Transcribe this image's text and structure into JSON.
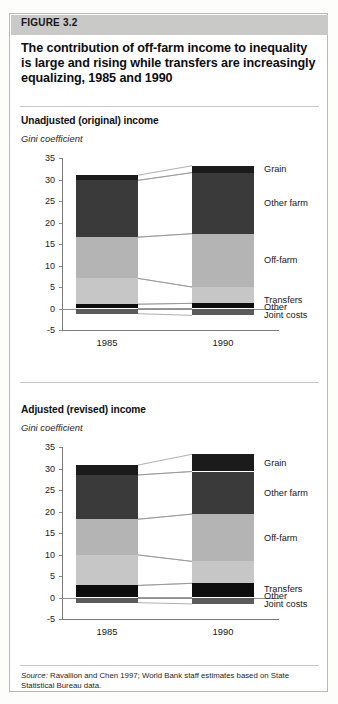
{
  "figure": {
    "band_label": "FIGURE 3.2",
    "title": "The contribution of off-farm income to inequality is large and rising while transfers are increasingly equalizing, 1985 and 1990",
    "source_prefix": "Source:",
    "source_text": " Ravallion and Chen 1997; World Bank staff estimates based on State Statistical Bureau data."
  },
  "panels": [
    {
      "title": "Unadjusted (original) income",
      "subtitle": "Gini coefficient"
    },
    {
      "title": "Adjusted (revised) income",
      "subtitle": "Gini coefficient"
    }
  ],
  "colors": {
    "grain": "#1b1b1b",
    "other_farm": "#3a3a3a",
    "off_farm": "#b4b4b4",
    "transfers": "#c6c6c6",
    "other": "#0d0d0d",
    "joint_costs": "#5b5b5b",
    "band": "#c9c9c7",
    "axis": "#7b7b79",
    "border": "#b9b9b7"
  },
  "chart_data": [
    {
      "type": "bar",
      "title": "Unadjusted (original) income",
      "subtitle": "Gini coefficient",
      "stacked": true,
      "xlabel": "",
      "ylabel": "Gini coefficient",
      "ylim": [
        -5,
        35
      ],
      "yticks": [
        -5,
        0,
        5,
        10,
        15,
        20,
        25,
        30,
        35
      ],
      "grid": false,
      "legend_position": "right-of-bars",
      "categories": [
        "1985",
        "1990"
      ],
      "series": [
        {
          "name": "Grain",
          "values": [
            1.2,
            1.6
          ]
        },
        {
          "name": "Other farm",
          "values": [
            13.2,
            14.2
          ]
        },
        {
          "name": "Off-farm",
          "values": [
            9.6,
            12.4
          ]
        },
        {
          "name": "Transfers",
          "values": [
            6.0,
            3.8
          ]
        },
        {
          "name": "Other",
          "values": [
            1.0,
            1.2
          ]
        },
        {
          "name": "Joint costs",
          "values": [
            -1.2,
            -1.6
          ]
        }
      ],
      "totals": [
        30.0,
        33.9
      ],
      "annotations": [
        "Grain",
        "Other farm",
        "Off-farm",
        "Transfers",
        "Other",
        "Joint costs"
      ]
    },
    {
      "type": "bar",
      "title": "Adjusted (revised) income",
      "subtitle": "Gini coefficient",
      "stacked": true,
      "xlabel": "",
      "ylabel": "Gini coefficient",
      "ylim": [
        -5,
        35
      ],
      "yticks": [
        -5,
        0,
        5,
        10,
        15,
        20,
        25,
        30,
        35
      ],
      "grid": false,
      "legend_position": "right-of-bars",
      "categories": [
        "1985",
        "1990"
      ],
      "series": [
        {
          "name": "Grain",
          "values": [
            2.3,
            4.0
          ]
        },
        {
          "name": "Other farm",
          "values": [
            10.3,
            9.9
          ]
        },
        {
          "name": "Off-farm",
          "values": [
            8.3,
            11.0
          ]
        },
        {
          "name": "Transfers",
          "values": [
            7.1,
            5.1
          ]
        },
        {
          "name": "Other",
          "values": [
            2.8,
            3.3
          ]
        },
        {
          "name": "Joint costs",
          "values": [
            -1.2,
            -1.5
          ]
        }
      ],
      "totals": [
        28.2,
        30.3
      ],
      "annotations": [
        "Grain",
        "Other farm",
        "Off-farm",
        "Transfers",
        "Other",
        "Joint costs"
      ]
    }
  ]
}
